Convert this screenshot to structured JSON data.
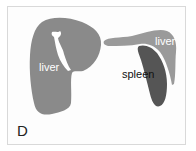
{
  "figure": {
    "panel_label": "D",
    "labels": {
      "liver_left": "liver",
      "liver_right": "liver",
      "spleen": "spleen"
    },
    "colors": {
      "liver": "#8a8a8a",
      "liver_right": "#9a9a9a",
      "spleen": "#555555",
      "label_light": "#ffffff",
      "label_dark": "#111111",
      "frame": "#d9d9d9"
    }
  }
}
